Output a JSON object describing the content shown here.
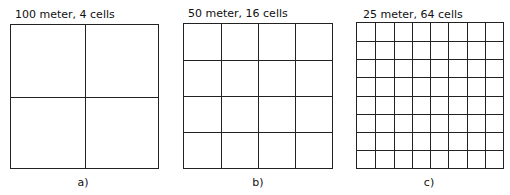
{
  "panels": [
    {
      "title": "100 meter, 4 cells",
      "caption": "a)",
      "divisions": 2
    },
    {
      "title": "50 meter, 16 cells",
      "caption": "b)",
      "divisions": 4
    },
    {
      "title": "25 meter, 64 cells",
      "caption": "c)",
      "divisions": 8
    }
  ]
}
